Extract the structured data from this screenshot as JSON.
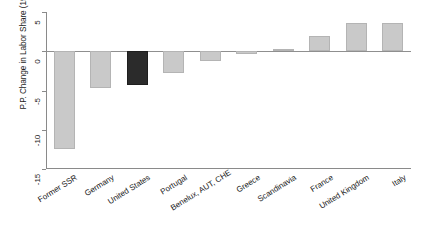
{
  "chart_data": {
    "type": "bar",
    "title": "",
    "xlabel": "",
    "ylabel": "P.P. Change in Labor Share (1995 to 2017)",
    "ylim": [
      -15,
      5
    ],
    "yticks": [
      5,
      0,
      -5,
      -10,
      -15
    ],
    "ytick_labels": [
      "5",
      "0",
      "-5",
      "-10",
      "-15"
    ],
    "grid": false,
    "legend": null,
    "categories": [
      "Former SSR",
      "Germany",
      "United States",
      "Portugal",
      "Benelux, AUT, CHE",
      "Greece",
      "Scandinavia",
      "France",
      "United Kingdom",
      "Italy"
    ],
    "values": [
      -12.5,
      -4.7,
      -4.3,
      -2.8,
      -1.3,
      -0.3,
      0.3,
      2.0,
      3.6,
      3.6
    ],
    "highlight_index": 2,
    "colors": {
      "bar": "#c9c9c9",
      "bar_highlight": "#2b2b2b",
      "axis": "#8a8a8a",
      "text": "#1a1a1a",
      "background": "#ffffff"
    }
  }
}
